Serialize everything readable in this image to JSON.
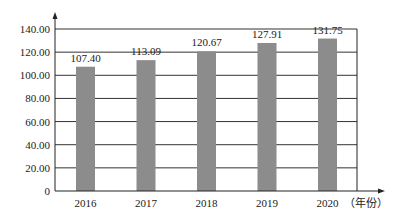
{
  "chart_data": {
    "type": "bar",
    "title": "",
    "xlabel": "（年份）",
    "ylabel": "",
    "categories": [
      "2016",
      "2017",
      "2018",
      "2019",
      "2020"
    ],
    "values": [
      107.4,
      113.09,
      120.67,
      127.91,
      131.75
    ],
    "value_labels": [
      "107.40",
      "113.09",
      "120.67",
      "127.91",
      "131.75"
    ],
    "yticks": [
      "0",
      "20.00",
      "40.00",
      "60.00",
      "80.00",
      "100.00",
      "120.00",
      "140.00"
    ],
    "ylim": [
      0,
      140
    ],
    "grid": true,
    "legend": null,
    "bar_color": "#8c8c8c"
  }
}
